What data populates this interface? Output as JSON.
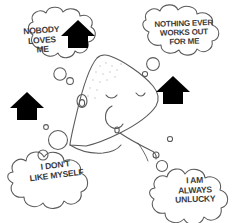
{
  "illustration": {
    "title": "Sad cartoon elephant with negative self-talk thought bubbles",
    "background_color": "#ffffff",
    "ink_color": "#4a4a4a",
    "arrow_color": "#000000"
  },
  "character": {
    "name": "sad-elephant",
    "expression": "closed downcast eyes, sad",
    "features": [
      "trunk",
      "closed-eyes",
      "ear-spiral",
      "stippled-head-texture"
    ]
  },
  "thought_bubbles": [
    {
      "id": "nobody-loves-me",
      "position": "top-left",
      "lines": [
        "NOBODY",
        "LOVES",
        "ME"
      ],
      "text": "NOBODY\nLOVES\nME"
    },
    {
      "id": "nothing-ever-works-out",
      "position": "top-right",
      "lines": [
        "NOTHING EVER",
        "WORKS OUT",
        "FOR ME"
      ],
      "text": "NOTHING EVER\nWORKS OUT\nFOR ME"
    },
    {
      "id": "dont-like-myself",
      "position": "bottom-left",
      "lines": [
        "I DON'T",
        "LIKE MYSELF"
      ],
      "text": "I DON'T\nLIKE MYSELF"
    },
    {
      "id": "always-unlucky",
      "position": "bottom-right",
      "lines": [
        "I AM",
        "ALWAYS",
        "UNLUCKY"
      ],
      "text": "I AM\nALWAYS\nUNLUCKY"
    }
  ],
  "arrows": [
    {
      "id": "arrow-top-left",
      "direction": "up",
      "x": 78,
      "y": 20
    },
    {
      "id": "arrow-top-right",
      "direction": "up",
      "x": 173,
      "y": 76
    },
    {
      "id": "arrow-left",
      "direction": "up",
      "x": 18,
      "y": 92
    },
    {
      "id": "arrow-right",
      "direction": "up",
      "x": 120,
      "y": 88
    }
  ]
}
